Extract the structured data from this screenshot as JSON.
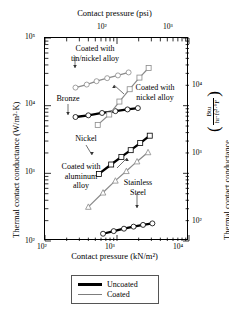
{
  "chart_data": {
    "type": "line",
    "title": "",
    "xlabel": "Contact pressure (kN/m²)",
    "xlabel_top": "Contact pressure (psi)",
    "ylabel": "Thermal contact conductance (W/m²·K)",
    "ylabel_right": "Thermal contact conductance",
    "ylabel_right_unit_numerator": "Btu",
    "ylabel_right_unit_denominator": "hr·ft²·°F",
    "xscale": "log",
    "yscale": "log",
    "xlim": [
      100,
      10000
    ],
    "ylim": [
      100,
      100000
    ],
    "xtick_labels": [
      "10²",
      "10³",
      "10⁴"
    ],
    "xtick_values": [
      100,
      1000,
      10000
    ],
    "ytick_labels": [
      "10²",
      "10³",
      "10⁴",
      "10⁵"
    ],
    "ytick_values": [
      100,
      1000,
      10000,
      100000
    ],
    "xtop_tick_labels": [
      "10²",
      "10³"
    ],
    "xtop_tick_values": [
      100,
      1000
    ],
    "xtop_unit": "psi",
    "ytick_right_labels": [
      "10²",
      "10³",
      "10⁴"
    ],
    "ytick_right_values": [
      100,
      1000,
      10000
    ],
    "grid": false,
    "legend_position": "below-plot",
    "series": [
      {
        "name": "Coated with tin/nickel alloy",
        "style": "coated",
        "color": "#8a8a8a",
        "marker": "circle-open",
        "points": [
          [
            265,
            18500
          ],
          [
            380,
            20500
          ],
          [
            520,
            23000
          ],
          [
            730,
            25500
          ],
          [
            1030,
            28000
          ],
          [
            1450,
            31000
          ]
        ]
      },
      {
        "name": "Bronze",
        "style": "uncoated",
        "color": "#000000",
        "marker": "circle-open",
        "points": [
          [
            265,
            6800
          ],
          [
            400,
            7200
          ],
          [
            620,
            7800
          ],
          [
            950,
            8300
          ],
          [
            1400,
            8800
          ],
          [
            1950,
            9200
          ]
        ]
      },
      {
        "name": "Coated with nickel alloy",
        "style": "coated",
        "color": "#8a8a8a",
        "marker": "square-open",
        "points": [
          [
            540,
            5200
          ],
          [
            780,
            7400
          ],
          [
            1080,
            11500
          ],
          [
            1500,
            17500
          ],
          [
            2050,
            26000
          ],
          [
            2750,
            36000
          ]
        ]
      },
      {
        "name": "Nickel",
        "style": "uncoated",
        "color": "#000000",
        "marker": "square-open",
        "points": [
          [
            560,
            980
          ],
          [
            830,
            1350
          ],
          [
            1150,
            1750
          ],
          [
            1550,
            2200
          ],
          [
            2100,
            2800
          ],
          [
            2850,
            3600
          ]
        ]
      },
      {
        "name": "Stainless Steel",
        "style": "coated",
        "color": "#8a8a8a",
        "marker": "triangle-open",
        "points": [
          [
            400,
            320
          ],
          [
            640,
            520
          ],
          [
            950,
            780
          ],
          [
            1350,
            1080
          ],
          [
            1900,
            1500
          ],
          [
            2700,
            2050
          ]
        ]
      },
      {
        "name": "Coated with aluminum alloy",
        "style": "uncoated",
        "color": "#000000",
        "marker": "circle-open",
        "points": [
          [
            640,
            128
          ],
          [
            900,
            140
          ],
          [
            1250,
            152
          ],
          [
            1700,
            163
          ],
          [
            2300,
            173
          ],
          [
            3100,
            182
          ]
        ]
      }
    ],
    "annotations": [
      {
        "text": "Coated with\ntin/nickel alloy",
        "target_series": "Coated with tin/nickel alloy"
      },
      {
        "text": "Bronze",
        "target_series": "Bronze"
      },
      {
        "text": "Coated with\nnickel alloy",
        "target_series": "Coated with nickel alloy"
      },
      {
        "text": "Nickel",
        "target_series": "Nickel"
      },
      {
        "text": "Coated with\naluminum alloy",
        "target_series": "Coated with aluminum alloy"
      },
      {
        "text": "Stainless\nSteel",
        "target_series": "Stainless Steel"
      }
    ],
    "legend": [
      {
        "label": "Uncoated",
        "style": "thick-black",
        "color": "#000000"
      },
      {
        "label": "Coated",
        "style": "thin-gray",
        "color": "#7d7d7d"
      }
    ]
  },
  "labels": {
    "top_axis_title": "Contact pressure (psi)",
    "bottom_axis_title": "Contact pressure (kN/m²)",
    "left_axis_title": "Thermal contact conductance (W/m²·K)",
    "right_axis_title": "Thermal contact conductance",
    "right_unit_num": "Btu",
    "right_unit_den": "hr·ft²·°F",
    "anno_tin_nickel_l1": "Coated with",
    "anno_tin_nickel_l2": "tin/nickel alloy",
    "anno_bronze": "Bronze",
    "anno_nickel_alloy_l1": "Coated with",
    "anno_nickel_alloy_l2": "nickel alloy",
    "anno_nickel": "Nickel",
    "anno_alum_l1": "Coated with",
    "anno_alum_l2": "aluminum",
    "anno_alum_l3": "alloy",
    "anno_ss_l1": "Stainless",
    "anno_ss_l2": "Steel",
    "legend_uncoated": "Uncoated",
    "legend_coated": "Coated",
    "yt_100000": "10⁵",
    "yt_10000": "10⁴",
    "yt_1000": "10³",
    "yt_100": "10²",
    "xt_100": "10²",
    "xt_1000": "10³",
    "xt_10000": "10⁴",
    "xtop_100": "10²",
    "xtop_1000": "10³",
    "ytr_10000": "10⁴",
    "ytr_1000": "10³",
    "ytr_100": "10²"
  }
}
